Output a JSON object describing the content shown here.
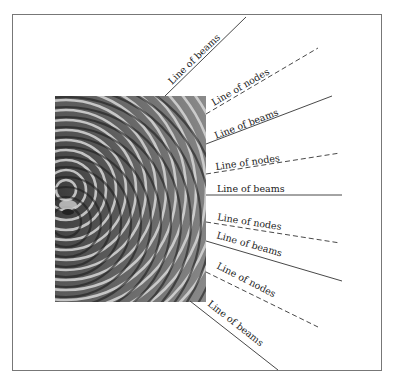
{
  "figure": {
    "title": "",
    "colors": {
      "frame": "#777777",
      "line": "#333333",
      "text": "#222222",
      "background": "#ffffff"
    }
  },
  "labels": [
    {
      "id": "beams-1",
      "text": "Line of  beams",
      "type": "beams"
    },
    {
      "id": "nodes-1",
      "text": "Line of nodes",
      "type": "nodes"
    },
    {
      "id": "beams-2",
      "text": "Line of beams",
      "type": "beams"
    },
    {
      "id": "nodes-2",
      "text": "Line of nodes",
      "type": "nodes"
    },
    {
      "id": "beams-3",
      "text": "Line of beams",
      "type": "beams"
    },
    {
      "id": "nodes-3",
      "text": "Line of nodes",
      "type": "nodes"
    },
    {
      "id": "beams-4",
      "text": "Line of beams",
      "type": "beams"
    },
    {
      "id": "nodes-4",
      "text": "Line of nodes",
      "type": "nodes"
    },
    {
      "id": "beams-5",
      "text": "Line of beams",
      "type": "beams"
    }
  ],
  "legend": {
    "solid": "Line of beams",
    "dashed": "Line of nodes"
  }
}
